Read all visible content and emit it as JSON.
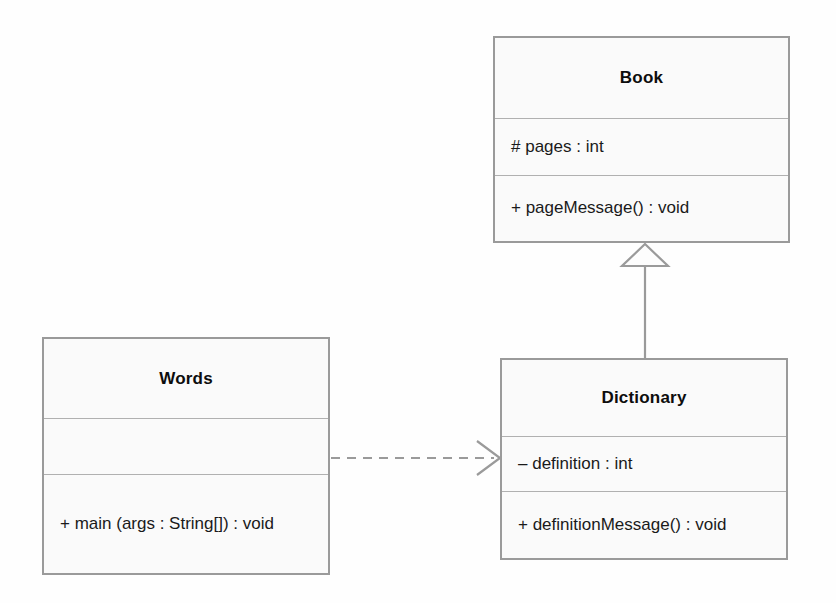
{
  "diagram": {
    "type": "uml-class-diagram",
    "canvas": {
      "width": 836,
      "height": 603
    },
    "colors": {
      "background": "#fefefe",
      "class_fill": "#fafafa",
      "class_border": "#9a9a9a",
      "compartment_divider": "#b0b0b0",
      "connector": "#9a9a9a",
      "text": "#1a1a1a"
    }
  },
  "classes": {
    "book": {
      "name": "Book",
      "attributes": [
        "# pages : int"
      ],
      "operations": [
        "+ pageMessage() : void"
      ],
      "box": {
        "x": 493,
        "y": 36,
        "width": 297,
        "height": 207
      },
      "compartment_heights": [
        81,
        57,
        67
      ]
    },
    "words": {
      "name": "Words",
      "attributes": [
        ""
      ],
      "operations": [
        "+ main (args : String[]) : void"
      ],
      "box": {
        "x": 42,
        "y": 337,
        "width": 288,
        "height": 238
      },
      "compartment_heights": [
        80,
        56,
        100
      ]
    },
    "dictionary": {
      "name": "Dictionary",
      "attributes": [
        "– definition : int"
      ],
      "operations": [
        "+ definitionMessage() : void"
      ],
      "box": {
        "x": 500,
        "y": 358,
        "width": 288,
        "height": 202
      },
      "compartment_heights": [
        77,
        55,
        68
      ]
    }
  },
  "relationships": [
    {
      "id": "generalization-dictionary-book",
      "kind": "generalization",
      "label": "inheritance",
      "source": "Dictionary",
      "target": "Book",
      "line_style": "solid",
      "arrowhead": "hollow-triangle"
    },
    {
      "id": "dependency-words-dictionary",
      "kind": "dependency",
      "label": "dependency",
      "source": "Words",
      "target": "Dictionary",
      "line_style": "dashed",
      "arrowhead": "open-arrow"
    }
  ]
}
